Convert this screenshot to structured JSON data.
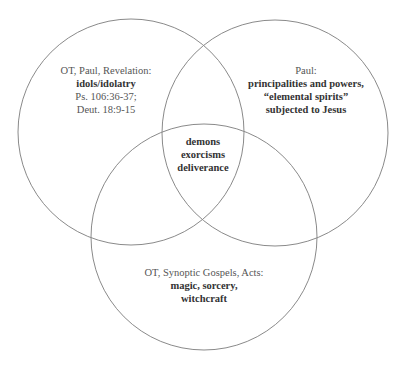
{
  "diagram": {
    "type": "venn",
    "circles": [
      {
        "id": "left",
        "cx": 131,
        "cy": 132,
        "r": 113
      },
      {
        "id": "right",
        "cx": 275,
        "cy": 133,
        "r": 113
      },
      {
        "id": "bottom",
        "cx": 204,
        "cy": 237,
        "r": 113
      }
    ],
    "stroke_color": "#8a8a8a"
  },
  "regions": {
    "left": {
      "source": "OT, Paul, Revelation:",
      "topic": "idols/idolatry",
      "refs": [
        "Ps. 106:36-37;",
        "Deut. 18:9-15"
      ]
    },
    "right": {
      "source": "Paul:",
      "topics": [
        "principalities and powers,",
        "“elemental spirits”",
        "subjected to Jesus"
      ]
    },
    "center": {
      "topics": [
        "demons",
        "exorcisms",
        "deliverance"
      ]
    },
    "bottom": {
      "source": "OT, Synoptic Gospels, Acts:",
      "topics": [
        "magic, sorcery,",
        "witchcraft"
      ]
    }
  }
}
